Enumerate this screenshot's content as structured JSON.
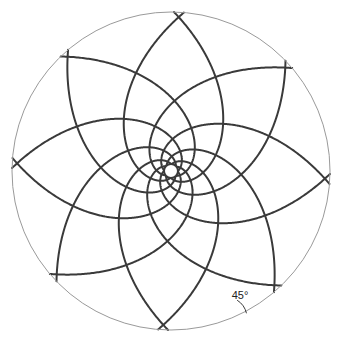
{
  "figure": {
    "background_color": "#ffffff",
    "width": 341,
    "height": 341
  },
  "bounding_circle": {
    "name": "outer boundary circle",
    "center_x": 171,
    "center_y": 171,
    "radius": 159,
    "stroke_color": "#9a9a9a",
    "stroke_width": 1,
    "fill": "none"
  },
  "center_disc": {
    "name": "central white disc",
    "center_x": 171,
    "center_y": 171,
    "radius": 7,
    "fill_color": "#ffffff",
    "stroke_color": "#3a3a3a",
    "stroke_width": 2
  },
  "spirals": {
    "type": "logarithmic",
    "equation": "r = a * exp(theta * cot(45°))",
    "pitch_angle_degrees": 45,
    "arms_per_family": 8,
    "families": [
      {
        "name": "clockwise-family",
        "direction": "clockwise",
        "handedness": -1
      },
      {
        "name": "counterclockwise-family",
        "direction": "counterclockwise",
        "handedness": 1
      }
    ],
    "stroke_color": "#3a3a3a",
    "stroke_width": 2,
    "inner_radius": 7,
    "outer_radius": 159
  },
  "annotation": {
    "name": "angle-annotation",
    "label": "45°",
    "label_x": 240,
    "label_y": 299,
    "arc": {
      "vertex_x": 226,
      "vertex_y": 318,
      "radius": 21,
      "start_angle_degrees": -58,
      "end_angle_degrees": -13,
      "stroke_color": "#3a3a3a",
      "stroke_width": 1
    },
    "description": "Angle of intersection between spiral and bounding circle"
  },
  "colors": {
    "spiral_stroke": "#3a3a3a",
    "boundary_stroke": "#9a9a9a",
    "text": "#222222",
    "background": "#ffffff"
  }
}
